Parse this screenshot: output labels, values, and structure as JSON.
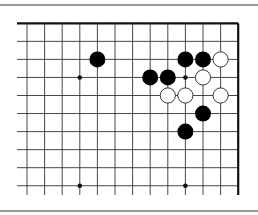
{
  "diagram": {
    "type": "go-board-corner",
    "colors": {
      "background": "#ffffff",
      "grid_line": "#333333",
      "edge_line": "#111111",
      "black_stone": "#000000",
      "white_stone": "#ffffff",
      "white_stone_outline": "#222222",
      "rule_line": "#9a9a9a"
    },
    "grid": {
      "columns": 13,
      "rows": 10,
      "origin_x": 27,
      "origin_y": 23.3,
      "col_spacing": 17.6,
      "row_spacing": 18.05,
      "line_start_x": 17,
      "line_end_y": 195,
      "top_edge": true,
      "right_edge": true
    },
    "star_points": [
      {
        "col": 3,
        "row": 3
      },
      {
        "col": 9,
        "row": 3
      },
      {
        "col": 3,
        "row": 9
      },
      {
        "col": 9,
        "row": 9
      }
    ],
    "black_stones": [
      {
        "col": 4,
        "row": 2
      },
      {
        "col": 9,
        "row": 2
      },
      {
        "col": 10,
        "row": 2
      },
      {
        "col": 7,
        "row": 3
      },
      {
        "col": 8,
        "row": 3
      },
      {
        "col": 10,
        "row": 5
      },
      {
        "col": 9,
        "row": 6
      }
    ],
    "white_stones": [
      {
        "col": 11,
        "row": 2
      },
      {
        "col": 10,
        "row": 3
      },
      {
        "col": 8,
        "row": 4
      },
      {
        "col": 9,
        "row": 4
      },
      {
        "col": 11,
        "row": 4
      }
    ],
    "stone_radius": 8
  }
}
